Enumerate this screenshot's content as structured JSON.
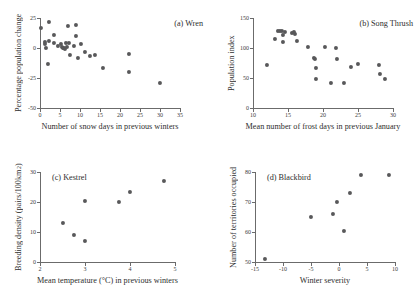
{
  "figure": {
    "background": "#ffffff",
    "marker_color": "#58585a",
    "axis_color": "#6b6b6b"
  },
  "chart_data": [
    {
      "type": "scatter",
      "title": "(a) Wren",
      "xlabel": "Number of snow days in previous winters",
      "ylabel": "Percentage population change",
      "xlim": [
        0,
        35
      ],
      "ylim": [
        -50,
        25
      ],
      "xticks": [
        0,
        5,
        10,
        15,
        20,
        25,
        30,
        35
      ],
      "yticks": [
        25,
        0,
        -25,
        -50
      ],
      "xticklabels": [
        "0",
        "5",
        "10",
        "15",
        "20",
        "25",
        "30",
        "35"
      ],
      "yticklabels": [
        "25",
        "0",
        "-25",
        "-50"
      ],
      "grid": false,
      "legend": "none",
      "points": [
        {
          "x": 0.2,
          "y": 17
        },
        {
          "x": 1.2,
          "y": 5
        },
        {
          "x": 1.3,
          "y": 3
        },
        {
          "x": 1.5,
          "y": 0
        },
        {
          "x": 2.2,
          "y": 22
        },
        {
          "x": 2.3,
          "y": 6
        },
        {
          "x": 2.0,
          "y": -13
        },
        {
          "x": 3.4,
          "y": 4
        },
        {
          "x": 3.6,
          "y": 11
        },
        {
          "x": 4.6,
          "y": 2
        },
        {
          "x": 5.2,
          "y": 3
        },
        {
          "x": 5.6,
          "y": 1
        },
        {
          "x": 5.8,
          "y": 0
        },
        {
          "x": 6.0,
          "y": 0
        },
        {
          "x": 6.2,
          "y": -1
        },
        {
          "x": 6.5,
          "y": 4
        },
        {
          "x": 6.7,
          "y": 1
        },
        {
          "x": 7.0,
          "y": 18
        },
        {
          "x": 7.3,
          "y": 4
        },
        {
          "x": 7.5,
          "y": -6
        },
        {
          "x": 8.6,
          "y": 2
        },
        {
          "x": 9.0,
          "y": 19
        },
        {
          "x": 9.1,
          "y": 10
        },
        {
          "x": 9.4,
          "y": -8
        },
        {
          "x": 10.3,
          "y": 3
        },
        {
          "x": 11.3,
          "y": -3
        },
        {
          "x": 12.4,
          "y": -7
        },
        {
          "x": 13.8,
          "y": -6
        },
        {
          "x": 15.7,
          "y": -17
        },
        {
          "x": 22.2,
          "y": -5
        },
        {
          "x": 22.3,
          "y": -20
        },
        {
          "x": 30.1,
          "y": -29
        }
      ]
    },
    {
      "type": "scatter",
      "title": "(b) Song Thrush",
      "xlabel": "Mean number of frost days in previous January",
      "ylabel": "Population index",
      "xlim": [
        10,
        30
      ],
      "ylim": [
        0,
        150
      ],
      "xticks": [
        10,
        15,
        20,
        25,
        30
      ],
      "yticks": [
        0,
        50,
        100,
        150
      ],
      "xticklabels": [
        "10",
        "15",
        "20",
        "25",
        "30"
      ],
      "yticklabels": [
        "0",
        "50",
        "100",
        "150"
      ],
      "grid": false,
      "legend": "none",
      "points": [
        {
          "x": 12.0,
          "y": 72
        },
        {
          "x": 13.1,
          "y": 115
        },
        {
          "x": 13.6,
          "y": 128
        },
        {
          "x": 13.9,
          "y": 129
        },
        {
          "x": 14.2,
          "y": 128
        },
        {
          "x": 14.3,
          "y": 122
        },
        {
          "x": 14.3,
          "y": 110
        },
        {
          "x": 14.5,
          "y": 127
        },
        {
          "x": 15.5,
          "y": 125
        },
        {
          "x": 15.8,
          "y": 126
        },
        {
          "x": 16.0,
          "y": 124
        },
        {
          "x": 16.3,
          "y": 112
        },
        {
          "x": 17.9,
          "y": 101
        },
        {
          "x": 18.7,
          "y": 83
        },
        {
          "x": 18.9,
          "y": 81
        },
        {
          "x": 19.0,
          "y": 66
        },
        {
          "x": 19.0,
          "y": 49
        },
        {
          "x": 20.3,
          "y": 101
        },
        {
          "x": 21.2,
          "y": 41
        },
        {
          "x": 21.9,
          "y": 100
        },
        {
          "x": 22.0,
          "y": 81
        },
        {
          "x": 23.0,
          "y": 41
        },
        {
          "x": 24.0,
          "y": 69
        },
        {
          "x": 25.0,
          "y": 73
        },
        {
          "x": 28.0,
          "y": 71
        },
        {
          "x": 28.1,
          "y": 56
        },
        {
          "x": 28.9,
          "y": 49
        }
      ]
    },
    {
      "type": "scatter",
      "title": "(c) Kestrel",
      "xlabel": "Mean temperature (°C) in previous winters",
      "ylabel": "Breeding density (pairs/100km²)",
      "xlim": [
        2,
        5
      ],
      "ylim": [
        0,
        30
      ],
      "xticks": [
        2,
        3,
        4,
        5
      ],
      "yticks": [
        0,
        10,
        20,
        30
      ],
      "xticklabels": [
        "2",
        "3",
        "4",
        "5"
      ],
      "yticklabels": [
        "0",
        "10",
        "20",
        "30"
      ],
      "grid": false,
      "legend": "none",
      "points": [
        {
          "x": 2.5,
          "y": 13.0
        },
        {
          "x": 2.75,
          "y": 9.1
        },
        {
          "x": 3.0,
          "y": 7.1
        },
        {
          "x": 3.0,
          "y": 20.5
        },
        {
          "x": 3.75,
          "y": 20.0
        },
        {
          "x": 4.0,
          "y": 23.4
        },
        {
          "x": 4.75,
          "y": 27.0
        }
      ]
    },
    {
      "type": "scatter",
      "title": "(d) Blackbird",
      "xlabel": "Winter severity",
      "ylabel": "Number of territories occupied",
      "xlim": [
        -15,
        10
      ],
      "ylim": [
        50,
        80
      ],
      "xticks": [
        -15,
        -10,
        -5,
        0,
        5,
        10
      ],
      "yticks": [
        50,
        60,
        70,
        80
      ],
      "xticklabels": [
        "-15",
        "-10",
        "-5",
        "0",
        "5",
        "10"
      ],
      "yticklabels": [
        "50",
        "60",
        "70",
        "80"
      ],
      "grid": false,
      "legend": "none",
      "points": [
        {
          "x": -13.2,
          "y": 51.0
        },
        {
          "x": -5.0,
          "y": 65.0
        },
        {
          "x": -1.1,
          "y": 66.0
        },
        {
          "x": -0.4,
          "y": 70.0
        },
        {
          "x": 0.9,
          "y": 60.2
        },
        {
          "x": 2.0,
          "y": 73.0
        },
        {
          "x": 4.0,
          "y": 79.0
        },
        {
          "x": 9.0,
          "y": 79.0
        }
      ]
    }
  ]
}
